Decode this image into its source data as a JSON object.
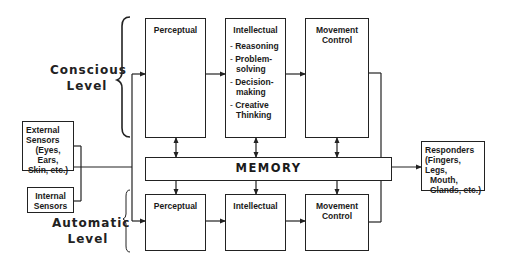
{
  "levels": {
    "conscious": {
      "line1": "Conscious",
      "line2": "Level"
    },
    "automatic": {
      "line1": "Automatic",
      "line2": "Level"
    }
  },
  "inputs": {
    "external": {
      "line1": "External",
      "line2": "Sensors",
      "line3": "(Eyes, Ears,",
      "line4": "Skin, etc.)"
    },
    "internal": {
      "line1": "Internal",
      "line2": "Sensors"
    }
  },
  "conscious_row": {
    "perceptual": {
      "title": "Perceptual"
    },
    "intellectual": {
      "title": "Intellectual",
      "items": [
        "Reasoning",
        "Problem-solving",
        "Decision-making",
        "Creative Thinking"
      ]
    },
    "movement": {
      "line1": "Movement",
      "line2": "Control"
    }
  },
  "memory": {
    "label": "MEMORY"
  },
  "automatic_row": {
    "perceptual": {
      "title": "Perceptual"
    },
    "intellectual": {
      "title": "Intellectual"
    },
    "movement": {
      "line1": "Movement",
      "line2": "Control"
    }
  },
  "output": {
    "responders": {
      "line1": "Responders",
      "line2": "(Fingers, Legs,",
      "line3": "Mouth,",
      "line4": "Glands, etc.)"
    }
  },
  "colors": {
    "line": "#222222",
    "background": "#ffffff"
  }
}
